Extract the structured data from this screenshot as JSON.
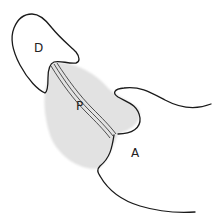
{
  "diagram": {
    "type": "anatomical-outline",
    "labels": {
      "d": "D",
      "p": "P",
      "a": "A"
    },
    "colors": {
      "outline": "#1a1a1a",
      "shading": "#d9d9d9",
      "background": "#ffffff"
    }
  }
}
